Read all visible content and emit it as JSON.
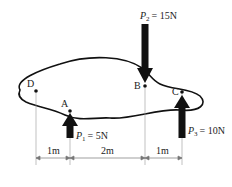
{
  "diagram": {
    "points": [
      {
        "id": "D",
        "label": "D",
        "x": 36,
        "y": 91
      },
      {
        "id": "A",
        "label": "A",
        "x": 70,
        "y": 111
      },
      {
        "id": "B",
        "label": "B",
        "x": 145,
        "y": 86
      },
      {
        "id": "C",
        "label": "C",
        "x": 182,
        "y": 92
      }
    ],
    "forces": [
      {
        "id": "P1",
        "symbol": "P",
        "sub": "1",
        "value": "= 5N",
        "direction": "up",
        "at": "A"
      },
      {
        "id": "P2",
        "symbol": "P",
        "sub": "2",
        "value": "= 15N",
        "direction": "down",
        "at": "B"
      },
      {
        "id": "P3",
        "symbol": "P",
        "sub": "3",
        "value": "= 10N",
        "direction": "up",
        "at": "C"
      }
    ],
    "dimensions": [
      {
        "label": "1m",
        "from": "D",
        "to": "A"
      },
      {
        "label": "2m",
        "from": "A",
        "to": "B"
      },
      {
        "label": "1m",
        "from": "B",
        "to": "C"
      }
    ],
    "colors": {
      "line": "#111111",
      "text": "#222222"
    }
  }
}
